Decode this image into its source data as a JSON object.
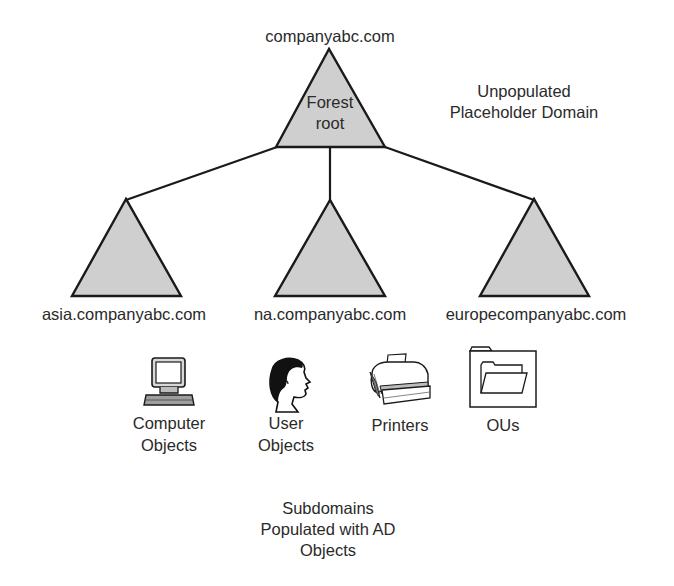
{
  "diagram": {
    "type": "active-directory-forest-tree",
    "colors": {
      "triangle_fill": "#cfcfcf",
      "stroke": "#1a1a1a",
      "text": "#2a2a2a",
      "background": "#ffffff"
    },
    "root": {
      "domain": "companyabc.com",
      "inner_label_line1": "Forest",
      "inner_label_line2": "root"
    },
    "root_note": {
      "line1": "Unpopulated",
      "line2": "Placeholder Domain"
    },
    "subdomains": [
      {
        "label": "asia.companyabc.com"
      },
      {
        "label": "na.companyabc.com"
      },
      {
        "label": "europecompanyabc.com"
      }
    ],
    "objects": [
      {
        "icon": "computer-icon",
        "line1": "Computer",
        "line2": "Objects"
      },
      {
        "icon": "user-head-icon",
        "line1": "User",
        "line2": "Objects"
      },
      {
        "icon": "printer-icon",
        "line1": "Printers",
        "line2": ""
      },
      {
        "icon": "folder-icon",
        "line1": "OUs",
        "line2": ""
      }
    ],
    "footer_note": {
      "line1": "Subdomains",
      "line2": "Populated with AD",
      "line3": "Objects"
    }
  }
}
